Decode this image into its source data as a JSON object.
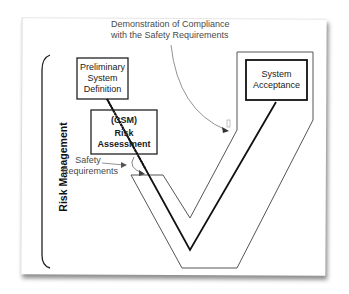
{
  "diagram": {
    "side_label": "Risk Management",
    "boxes": {
      "preliminary": {
        "lines": [
          "Preliminary",
          "System",
          "Definition"
        ]
      },
      "risk_assessment": {
        "lines": [
          "(CSM)",
          "Risk",
          "Assessment"
        ]
      },
      "system_acceptance": {
        "lines": [
          "System",
          "Acceptance"
        ]
      }
    },
    "annotations": {
      "demonstration": {
        "lines": [
          "Demonstration of Compliance",
          "with the Safety Requirements"
        ]
      },
      "safety_requirements": {
        "lines": [
          "Safety",
          "Requirements"
        ]
      }
    },
    "colors": {
      "line": "#111111",
      "outline": "#555555",
      "annotation_text": "#4a4a4a",
      "paper": "#ffffff"
    }
  }
}
